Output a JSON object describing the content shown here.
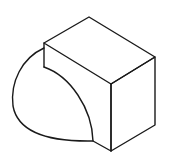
{
  "figure": {
    "stroke_color": "#1a1a1a",
    "background": "#ffffff",
    "shapes": {
      "block_top_face": "M44,43 L89,17 L155,57 L111,84 Z",
      "block_front_right_face": "M111,84 L155,57 L155,125 L111,151 Z",
      "block_left_face_edge": "M44,43 L44,67",
      "block_front_edge": "M111,84 L111,151",
      "inner_arc": "M44,67 C70,76 92,108 93,141 L111,151",
      "outer_arc": "M44,48 C22,58 10,82 13,106 C17,128 40,142 93,141"
    }
  }
}
